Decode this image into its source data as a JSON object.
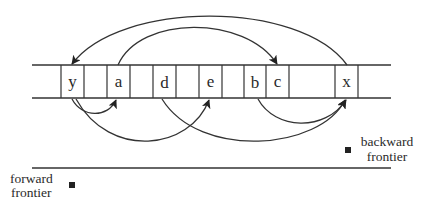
{
  "diagram": {
    "type": "bidirectional-search-array",
    "cells": [
      {
        "label": "y",
        "x": 61,
        "w": 23
      },
      {
        "label": "",
        "x": 84,
        "w": 23
      },
      {
        "label": "a",
        "x": 107,
        "w": 23
      },
      {
        "label": "",
        "x": 130,
        "w": 23
      },
      {
        "label": "d",
        "x": 153,
        "w": 23
      },
      {
        "label": "",
        "x": 176,
        "w": 23
      },
      {
        "label": "e",
        "x": 199,
        "w": 23
      },
      {
        "label": "",
        "x": 222,
        "w": 22
      },
      {
        "label": "b",
        "x": 244,
        "w": 22
      },
      {
        "label": "c",
        "x": 266,
        "w": 23
      },
      {
        "label": "",
        "x": 289,
        "w": 46
      },
      {
        "label": "x",
        "x": 335,
        "w": 23
      }
    ],
    "edges_above": [
      {
        "from": "x",
        "to": "y",
        "direction": "backward"
      },
      {
        "from": "a",
        "to": "c",
        "direction": "forward"
      }
    ],
    "edges_below": [
      {
        "from": "y",
        "to": "a"
      },
      {
        "from": "y",
        "to": "e"
      },
      {
        "from": "d",
        "to": "x"
      },
      {
        "from": "b",
        "to": "x"
      }
    ],
    "labels": {
      "backward_frontier": [
        "backward",
        "frontier"
      ],
      "forward_frontier": [
        "forward",
        "frontier"
      ]
    },
    "colors": {
      "ink": "#333333",
      "background": "#ffffff"
    }
  }
}
